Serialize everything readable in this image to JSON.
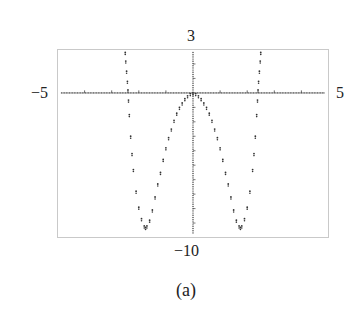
{
  "chart_data": {
    "type": "scatter",
    "title": "",
    "caption": "(a)",
    "xlabel": "",
    "ylabel": "",
    "xlim": [
      -5,
      5
    ],
    "ylim": [
      -10,
      3
    ],
    "tick_labels": {
      "xmin": "−5",
      "xmax": "5",
      "ymax": "3",
      "ymin": "−10"
    },
    "x_ticks": [
      -4,
      -3,
      -2,
      -1,
      1,
      2,
      3,
      4
    ],
    "grid": false,
    "legend": null,
    "series": [
      {
        "name": "graph",
        "style": "dotted",
        "x": [
          -2.5,
          -2.48,
          -2.45,
          -2.42,
          -2.4,
          -2.38,
          -2.35,
          -2.3,
          -2.25,
          -2.2,
          -2.1,
          -2.0,
          -1.9,
          -1.8,
          -1.75,
          -1.7,
          -1.6,
          -1.5,
          -1.4,
          -1.3,
          -1.2,
          -1.1,
          -1.0,
          -0.9,
          -0.8,
          -0.7,
          -0.6,
          -0.5,
          -0.4,
          -0.3,
          -0.2,
          -0.1,
          0,
          0.1,
          0.2,
          0.3,
          0.4,
          0.5,
          0.6,
          0.7,
          0.8,
          0.9,
          1.0,
          1.1,
          1.2,
          1.3,
          1.4,
          1.5,
          1.6,
          1.7,
          1.75,
          1.8,
          1.9,
          2.0,
          2.1,
          2.2,
          2.25,
          2.3,
          2.35,
          2.38,
          2.4,
          2.42,
          2.45,
          2.48,
          2.5
        ],
        "y": [
          2.8,
          2.2,
          1.5,
          0.8,
          0.2,
          -0.5,
          -1.5,
          -3.0,
          -4.2,
          -5.3,
          -6.8,
          -7.9,
          -8.7,
          -9.2,
          -9.3,
          -9.2,
          -8.8,
          -8.1,
          -7.2,
          -6.3,
          -5.5,
          -4.6,
          -3.8,
          -3.1,
          -2.5,
          -1.9,
          -1.4,
          -1.0,
          -0.7,
          -0.4,
          -0.2,
          -0.05,
          0,
          -0.05,
          -0.2,
          -0.4,
          -0.7,
          -1.0,
          -1.4,
          -1.9,
          -2.5,
          -3.1,
          -3.8,
          -4.6,
          -5.5,
          -6.3,
          -7.2,
          -8.1,
          -8.8,
          -9.2,
          -9.3,
          -9.2,
          -8.7,
          -7.9,
          -6.8,
          -5.3,
          -4.2,
          -3.0,
          -1.5,
          -0.5,
          0.2,
          0.8,
          1.5,
          2.2,
          2.8
        ]
      }
    ]
  },
  "caption": {
    "label": "(a)"
  },
  "axes": {
    "ymax_label": "3",
    "ymin_label": "−10",
    "xmin_label": "−5",
    "xmax_label": "5"
  }
}
